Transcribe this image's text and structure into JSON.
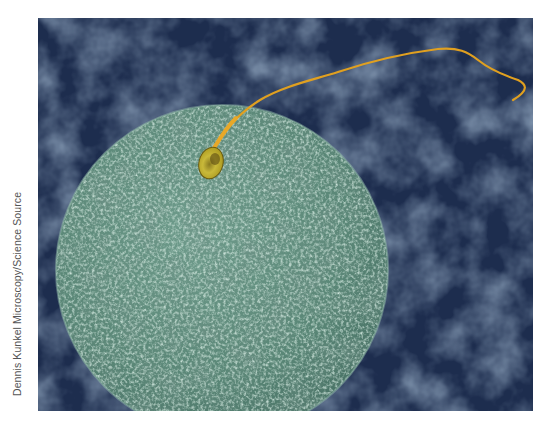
{
  "image": {
    "subject": "Scanning electron micrograph of a sperm cell on the surface of a human egg",
    "alt": "Green textured spherical egg cell with a single yellow-orange sperm attached at top, tail extending to upper right, on a dark blue mottled background",
    "credit": "Dennis Kunkel Microscopy/Science Source",
    "colors": {
      "background": "#1d2d4e",
      "background_light": "#3e5474",
      "egg": "#5e8c7e",
      "egg_highlight": "#9cc5b4",
      "egg_shadow": "#2f4f45",
      "sperm_head": "#c9b93a",
      "sperm_tail": "#e0a020",
      "page": "#ffffff"
    }
  }
}
